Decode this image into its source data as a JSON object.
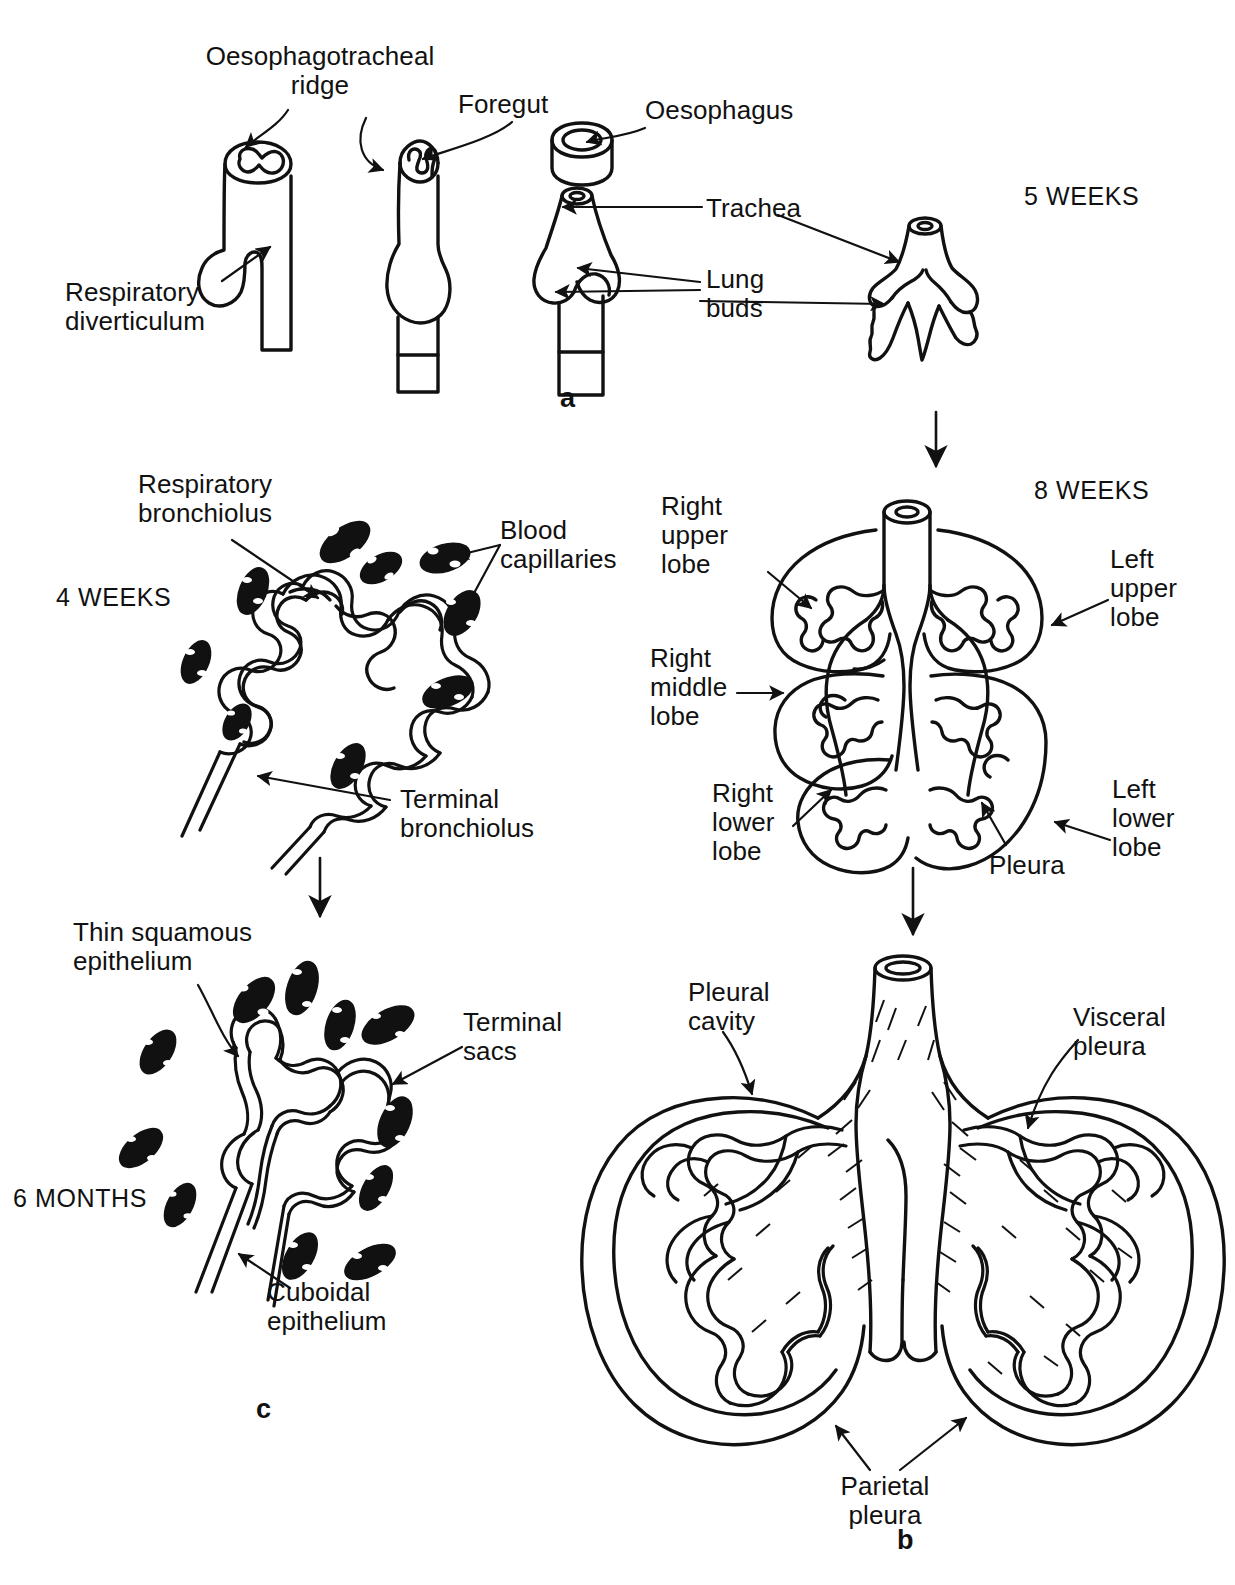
{
  "figure": {
    "background_color": "#ffffff",
    "ink_color": "#111111"
  },
  "panels": [
    {
      "id": "a",
      "letter": "a",
      "stage_label": "5 WEEKS",
      "description": "Four sequential stages of foregut division into oesophagus and trachea with lung buds"
    },
    {
      "id": "c",
      "letter": "c",
      "stage_labels": [
        "4 WEEKS",
        "6 MONTHS"
      ],
      "description": "Histology of respiratory bronchiolus and terminal sacs with blood capillaries"
    },
    {
      "id": "b",
      "letter": "b",
      "stage_label": "8 WEEKS",
      "description": "Developing lungs showing lobes, pleura and pleural cavity"
    }
  ],
  "stages": {
    "five_weeks": "5 WEEKS",
    "eight_weeks": "8 WEEKS",
    "four_weeks": "4 WEEKS",
    "six_months": "6 MONTHS"
  },
  "letters": {
    "a": "a",
    "b": "b",
    "c": "c"
  },
  "labels": {
    "oesophagotracheal_ridge": "Oesophagotracheal\nridge",
    "foregut": "Foregut",
    "oesophagus": "Oesophagus",
    "trachea": "Trachea",
    "lung_buds": "Lung\nbuds",
    "respiratory_diverticulum": "Respiratory\ndiverticulum",
    "respiratory_bronchiolus": "Respiratory\nbronchiolus",
    "blood_capillaries": "Blood\ncapillaries",
    "terminal_bronchiolus": "Terminal\nbronchiolus",
    "thin_squamous_epithelium": "Thin squamous\nepithelium",
    "terminal_sacs": "Terminal\nsacs",
    "cuboidal_epithelium": "Cuboidal\nepithelium",
    "right_upper_lobe": "Right\nupper\nlobe",
    "right_middle_lobe": "Right\nmiddle\nlobe",
    "right_lower_lobe": "Right\nlower\nlobe",
    "left_upper_lobe": "Left\nupper\nlobe",
    "left_lower_lobe": "Left\nlower\nlobe",
    "pleura": "Pleura",
    "pleural_cavity": "Pleural\ncavity",
    "visceral_pleura": "Visceral\npleura",
    "parietal_pleura": "Parietal\npleura"
  },
  "flow_arrows": [
    {
      "name": "a-to-8weeks",
      "from": "panel-a",
      "to": "8-weeks-lung"
    },
    {
      "name": "4weeks-to-6months",
      "from": "4-weeks-alveolus",
      "to": "6-months-alveolus"
    },
    {
      "name": "8weeks-to-mature",
      "from": "8-weeks-lung",
      "to": "mature-lung"
    }
  ]
}
